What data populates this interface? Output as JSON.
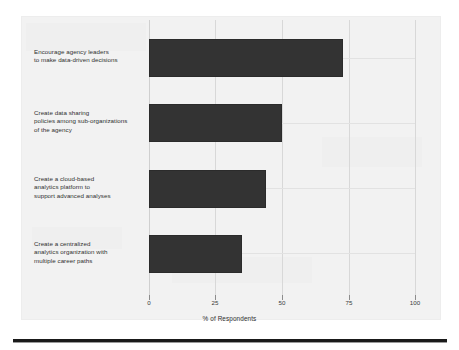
{
  "chart_data": {
    "type": "bar",
    "orientation": "horizontal",
    "title": "",
    "xlabel": "% of Respondents",
    "ylabel": "",
    "xlim": [
      0,
      100
    ],
    "ylim": [
      0,
      4
    ],
    "grid": true,
    "legend": null,
    "bar_color": "#333333",
    "panel_color": "#f2f2f2",
    "gridline_color": "#d8d8d8",
    "xticks": [
      0,
      25,
      50,
      75,
      100
    ],
    "xtick_labels": [
      "0",
      "25",
      "50",
      "75",
      "100"
    ],
    "categories": [
      "Encourage agency leaders to make data-driven decisions",
      "Create data sharing policies among sub-organizations of the agency",
      "Create a cloud-based analytics platform to support advanced analyses",
      "Create a centralized analytics organization with multiple career paths"
    ],
    "category_lines": [
      [
        "Encourage agency leaders",
        "to make data-driven decisions"
      ],
      [
        "Create data sharing",
        "policies among sub-organizations",
        "of the agency"
      ],
      [
        "Create a cloud-based",
        "analytics platform to",
        "support advanced analyses"
      ],
      [
        "Create a centralized",
        "analytics organization with",
        "multiple career paths"
      ]
    ],
    "values": [
      73,
      50,
      44,
      35
    ]
  },
  "figure": {
    "xaxis_title": "% of Respondents"
  }
}
